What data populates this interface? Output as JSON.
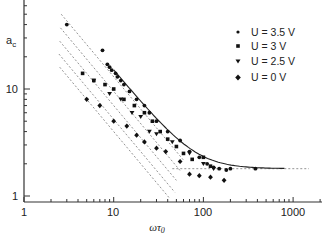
{
  "chart_data": {
    "type": "scatter",
    "title": "",
    "xlabel": "ωτ0",
    "ylabel": "a_c",
    "xscale": "log",
    "yscale": "log",
    "xlim": [
      1,
      2000
    ],
    "ylim": [
      1,
      60
    ],
    "x_ticks": [
      1,
      10,
      100,
      1000
    ],
    "x_tick_labels": [
      "1",
      "10",
      "100",
      "1000"
    ],
    "y_ticks": [
      1,
      10
    ],
    "y_tick_labels": [
      "1",
      "10"
    ],
    "grid": false,
    "legend_position": "top-right",
    "series": [
      {
        "name": "U = 3.5 V",
        "marker": "dot",
        "points": [
          [
            3.0,
            40
          ],
          [
            7.5,
            23
          ],
          [
            8.5,
            17
          ],
          [
            9.0,
            16
          ],
          [
            9.5,
            15
          ],
          [
            10.5,
            14
          ],
          [
            11,
            13
          ],
          [
            12,
            12
          ],
          [
            13,
            11
          ],
          [
            15,
            9.5
          ],
          [
            18,
            8
          ],
          [
            22,
            7
          ],
          [
            25,
            6
          ],
          [
            30,
            5
          ],
          [
            40,
            4
          ],
          [
            55,
            3.3
          ],
          [
            70,
            2.6
          ],
          [
            90,
            2.3
          ],
          [
            110,
            2.0
          ],
          [
            130,
            1.85
          ],
          [
            150,
            1.8
          ],
          [
            180,
            1.75
          ],
          [
            200,
            1.8
          ],
          [
            380,
            1.8
          ]
        ]
      },
      {
        "name": "U = 3 V",
        "marker": "square-dot",
        "points": [
          [
            4.5,
            14
          ],
          [
            6,
            12
          ],
          [
            8,
            11
          ],
          [
            10,
            10
          ],
          [
            13,
            8
          ],
          [
            17,
            7
          ],
          [
            22,
            6
          ],
          [
            27,
            5
          ],
          [
            33,
            4
          ],
          [
            40,
            3.4
          ],
          [
            50,
            2.9
          ],
          [
            60,
            2.5
          ],
          [
            75,
            2.2
          ],
          [
            100,
            2.3
          ],
          [
            120,
            1.9
          ]
        ]
      },
      {
        "name": "U = 2.5 V",
        "marker": "triangle-down",
        "points": [
          [
            6,
            12
          ],
          [
            9,
            9
          ],
          [
            12,
            8
          ],
          [
            16,
            6
          ],
          [
            20,
            5.5
          ],
          [
            25,
            4
          ],
          [
            30,
            3.8
          ],
          [
            45,
            3.2
          ],
          [
            70,
            2.5
          ],
          [
            100,
            2.0
          ],
          [
            130,
            1.8
          ]
        ]
      },
      {
        "name": "U = 0 V",
        "marker": "diamond",
        "points": [
          [
            5,
            8
          ],
          [
            7,
            7
          ],
          [
            10,
            5
          ],
          [
            14,
            4.5
          ],
          [
            18,
            3.7
          ],
          [
            22,
            3.2
          ],
          [
            30,
            2.8
          ],
          [
            38,
            2.6
          ],
          [
            55,
            2.1
          ],
          [
            70,
            1.6
          ],
          [
            90,
            1.55
          ],
          [
            120,
            1.5
          ],
          [
            170,
            1.4
          ]
        ]
      }
    ],
    "fit_lines": [
      {
        "name": "master-curve",
        "style": "solid",
        "description": "slope -1 decay leveling to plateau ~1.8",
        "x_range": [
          10,
          800
        ]
      },
      {
        "name": "plateau",
        "style": "dashed",
        "value": 1.8,
        "x_range": [
          45,
          1500
        ]
      },
      {
        "name": "diagonal-1",
        "style": "dashed",
        "slope": -1
      },
      {
        "name": "diagonal-2",
        "style": "dashed",
        "slope": -1
      },
      {
        "name": "diagonal-3",
        "style": "dashed",
        "slope": -1
      },
      {
        "name": "diagonal-4",
        "style": "dashed",
        "slope": -1
      },
      {
        "name": "diagonal-5",
        "style": "dashed",
        "slope": -1
      }
    ]
  },
  "axes": {
    "x_title_main": "ωτ",
    "x_title_sub": "0",
    "y_title_main": "a",
    "y_title_sub": "c"
  },
  "legend": {
    "items": [
      {
        "label": "U = 3.5 V"
      },
      {
        "label": "U = 3 V"
      },
      {
        "label": "U = 2.5 V"
      },
      {
        "label": "U = 0 V"
      }
    ]
  },
  "plot_style": {
    "axis_color": "#333333",
    "marker_color": "#111111",
    "dashed_color": "#888888",
    "curve_color": "#222222"
  }
}
